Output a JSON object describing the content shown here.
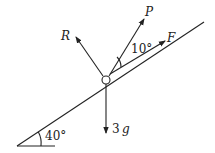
{
  "diagram": {
    "type": "force diagram on inclined plane",
    "incline_angle_label": "40°",
    "forces": [
      {
        "name": "R",
        "label": "R",
        "direction": "normal to plane"
      },
      {
        "name": "P",
        "label": "P",
        "direction": "10° above line of greatest slope"
      },
      {
        "name": "F",
        "label": "F",
        "direction": "up the plane, parallel"
      },
      {
        "name": "weight",
        "label": "3",
        "label_var": "g",
        "direction": "vertically down"
      }
    ],
    "angle_between_P_and_plane": "10°"
  }
}
